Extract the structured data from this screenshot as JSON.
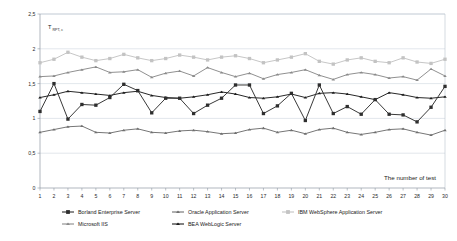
{
  "chart_data": {
    "type": "line",
    "title": "",
    "xlabel": "The number of test",
    "ylabel": "T",
    "ylabel_sub": "RPT, c",
    "xlim": [
      1,
      30
    ],
    "ylim": [
      0,
      2.5
    ],
    "grid": true,
    "legend_position": "bottom",
    "x": [
      1,
      2,
      3,
      4,
      5,
      6,
      7,
      8,
      9,
      10,
      11,
      12,
      13,
      14,
      15,
      16,
      17,
      18,
      19,
      20,
      21,
      22,
      23,
      24,
      25,
      26,
      27,
      28,
      29,
      30
    ],
    "yticks": [
      0,
      0.5,
      1,
      1.5,
      2,
      2.5
    ],
    "ytick_labels": [
      "0",
      "0,5",
      "1",
      "1,5",
      "2",
      "2,5"
    ],
    "xtick_labels": [
      "1",
      "2",
      "3",
      "4",
      "5",
      "6",
      "7",
      "8",
      "9",
      "10",
      "11",
      "12",
      "13",
      "14",
      "15",
      "16",
      "17",
      "18",
      "19",
      "20",
      "21",
      "22",
      "23",
      "24",
      "25",
      "26",
      "27",
      "28",
      "29",
      "30"
    ],
    "series": [
      {
        "name": "Borland Enterprise Server",
        "color": "#2e2e2e",
        "marker": "square",
        "values": [
          1.1,
          1.5,
          0.99,
          1.2,
          1.19,
          1.3,
          1.49,
          1.4,
          1.08,
          1.29,
          1.29,
          1.07,
          1.19,
          1.29,
          1.48,
          1.48,
          1.07,
          1.18,
          1.36,
          0.97,
          1.48,
          1.07,
          1.17,
          1.06,
          1.27,
          1.06,
          1.05,
          0.95,
          1.16,
          1.46
        ]
      },
      {
        "name": "Oracle Application Server",
        "color": "#6f6f6f",
        "marker": "triangle",
        "values": [
          0.8,
          0.84,
          0.88,
          0.89,
          0.8,
          0.79,
          0.83,
          0.85,
          0.8,
          0.79,
          0.82,
          0.83,
          0.81,
          0.78,
          0.79,
          0.84,
          0.86,
          0.8,
          0.83,
          0.78,
          0.84,
          0.86,
          0.8,
          0.77,
          0.8,
          0.84,
          0.85,
          0.8,
          0.76,
          0.83
        ]
      },
      {
        "name": "IBM WebSphere Application Server",
        "color": "#c3c3c3",
        "marker": "square",
        "values": [
          1.8,
          1.85,
          1.95,
          1.88,
          1.83,
          1.86,
          1.92,
          1.87,
          1.83,
          1.86,
          1.91,
          1.88,
          1.84,
          1.88,
          1.9,
          1.86,
          1.8,
          1.84,
          1.88,
          1.93,
          1.82,
          1.78,
          1.84,
          1.87,
          1.82,
          1.8,
          1.87,
          1.81,
          1.79,
          1.85
        ]
      },
      {
        "name": "Microsoft IIS",
        "color": "#8a8a8a",
        "marker": "triangle",
        "values": [
          1.6,
          1.61,
          1.66,
          1.7,
          1.74,
          1.66,
          1.67,
          1.7,
          1.59,
          1.65,
          1.68,
          1.61,
          1.73,
          1.66,
          1.6,
          1.65,
          1.57,
          1.63,
          1.66,
          1.7,
          1.62,
          1.56,
          1.63,
          1.66,
          1.63,
          1.58,
          1.6,
          1.55,
          1.71,
          1.61
        ]
      },
      {
        "name": "BEA WebLogic Server",
        "color": "#1c1c1c",
        "marker": "triangle",
        "values": [
          1.3,
          1.34,
          1.39,
          1.37,
          1.35,
          1.33,
          1.37,
          1.39,
          1.33,
          1.3,
          1.29,
          1.31,
          1.34,
          1.38,
          1.35,
          1.3,
          1.29,
          1.31,
          1.35,
          1.3,
          1.36,
          1.37,
          1.35,
          1.31,
          1.27,
          1.37,
          1.34,
          1.3,
          1.29,
          1.31
        ]
      }
    ],
    "legend": [
      {
        "label": "Borland Enterprise Server",
        "color": "#2e2e2e",
        "marker": "square"
      },
      {
        "label": "Oracle Application Server",
        "color": "#6f6f6f",
        "marker": "triangle"
      },
      {
        "label": "IBM WebSphere Application Server",
        "color": "#c3c3c3",
        "marker": "square"
      },
      {
        "label": "Microsoft IIS",
        "color": "#8a8a8a",
        "marker": "triangle"
      },
      {
        "label": "BEA WebLogic Server",
        "color": "#1c1c1c",
        "marker": "triangle"
      }
    ]
  }
}
